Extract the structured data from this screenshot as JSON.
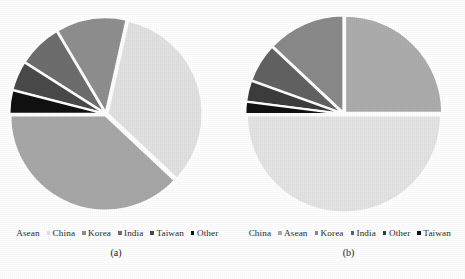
{
  "figure": {
    "background": "#ffffff",
    "panel_count": 2
  },
  "panels": [
    {
      "id": "a",
      "subcaption": "(a)",
      "legend": [
        {
          "label": "Asean",
          "color": "#a8a8a8"
        },
        {
          "label": "China",
          "color": "#e2e2e2"
        },
        {
          "label": "Korea",
          "color": "#8f8f8f"
        },
        {
          "label": "India",
          "color": "#6e6e6e"
        },
        {
          "label": "Taiwan",
          "color": "#4a4a4a"
        },
        {
          "label": "Other",
          "color": "#111111"
        }
      ]
    },
    {
      "id": "b",
      "subcaption": "(b)",
      "legend": [
        {
          "label": "China",
          "color": "#e4e4e4"
        },
        {
          "label": "Asean",
          "color": "#adadad"
        },
        {
          "label": "Korea",
          "color": "#8a8a8a"
        },
        {
          "label": "India",
          "color": "#626262"
        },
        {
          "label": "Other",
          "color": "#3d3d3d"
        },
        {
          "label": "Taiwan",
          "color": "#121212"
        }
      ]
    }
  ],
  "chart_data": [
    {
      "type": "pie",
      "title": "(a)",
      "labels": [
        "Asean",
        "China",
        "Korea",
        "India",
        "Taiwan",
        "Other"
      ],
      "values": [
        38.0,
        33.5,
        12.0,
        7.5,
        5.0,
        4.0
      ],
      "colors": [
        "#a8a8a8",
        "#e2e2e2",
        "#8f8f8f",
        "#6e6e6e",
        "#4a4a4a",
        "#111111"
      ],
      "units": "percent",
      "start_angle_deg": 180,
      "direction": "counterclockwise",
      "exploded": true,
      "legend_position": "bottom",
      "grid": false
    },
    {
      "type": "pie",
      "title": "(b)",
      "labels": [
        "China",
        "Asean",
        "Korea",
        "India",
        "Other",
        "Taiwan"
      ],
      "values": [
        50.0,
        25.0,
        13.0,
        6.5,
        3.5,
        2.0
      ],
      "colors": [
        "#e4e4e4",
        "#adadad",
        "#8a8a8a",
        "#626262",
        "#3d3d3d",
        "#121212"
      ],
      "units": "percent",
      "start_angle_deg": 180,
      "direction": "counterclockwise",
      "exploded": true,
      "legend_position": "bottom",
      "grid": false
    }
  ]
}
